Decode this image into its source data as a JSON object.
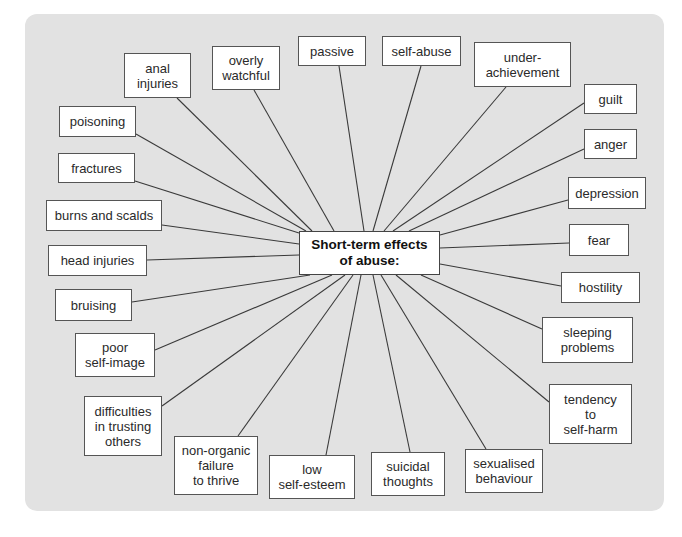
{
  "diagram": {
    "type": "spider-diagram",
    "colors": {
      "panel": "#e2e2e2",
      "box": "#ffffff",
      "border": "#555555",
      "line": "#3a3a3a",
      "text": "#2a2a2a"
    },
    "center": {
      "label": "Short-term effects\nof abuse:",
      "box": [
        299,
        231,
        141,
        44
      ]
    },
    "nodes": [
      {
        "id": "anal-injuries",
        "label": "anal\ninjuries",
        "box": [
          124,
          53,
          67,
          45
        ],
        "line": [
          177,
          98,
          312,
          231
        ]
      },
      {
        "id": "overly-watchful",
        "label": "overly\nwatchful",
        "box": [
          212,
          46,
          68,
          44
        ],
        "line": [
          254,
          90,
          334,
          231
        ]
      },
      {
        "id": "passive",
        "label": "passive",
        "box": [
          298,
          36,
          68,
          30
        ],
        "line": [
          339,
          66,
          364,
          231
        ]
      },
      {
        "id": "self-abuse",
        "label": "self-abuse",
        "box": [
          382,
          36,
          79,
          30
        ],
        "line": [
          421,
          66,
          373,
          231
        ]
      },
      {
        "id": "under-achievement",
        "label": "under-\nachievement",
        "box": [
          474,
          42,
          97,
          45
        ],
        "line": [
          506,
          87,
          384,
          231
        ]
      },
      {
        "id": "guilt",
        "label": "guilt",
        "box": [
          584,
          84,
          53,
          30
        ],
        "line": [
          584,
          103,
          393,
          231
        ]
      },
      {
        "id": "anger",
        "label": "anger",
        "box": [
          584,
          129,
          53,
          30
        ],
        "line": [
          584,
          149,
          409,
          231
        ]
      },
      {
        "id": "depression",
        "label": "depression",
        "box": [
          568,
          177,
          78,
          32
        ],
        "line": [
          568,
          200,
          440,
          235
        ]
      },
      {
        "id": "fear",
        "label": "fear",
        "box": [
          569,
          224,
          60,
          32
        ],
        "line": [
          569,
          243,
          440,
          248
        ]
      },
      {
        "id": "hostility",
        "label": "hostility",
        "box": [
          561,
          272,
          79,
          31
        ],
        "line": [
          561,
          286,
          440,
          264
        ]
      },
      {
        "id": "sleeping-problems",
        "label": "sleeping\nproblems",
        "box": [
          542,
          317,
          91,
          46
        ],
        "line": [
          542,
          329,
          421,
          275
        ]
      },
      {
        "id": "tendency-to-self-harm",
        "label": "tendency\nto\nself-harm",
        "box": [
          549,
          384,
          83,
          60
        ],
        "line": [
          549,
          402,
          396,
          275
        ]
      },
      {
        "id": "sexualised-behaviour",
        "label": "sexualised\nbehaviour",
        "box": [
          465,
          449,
          78,
          44
        ],
        "line": [
          486,
          449,
          381,
          275
        ]
      },
      {
        "id": "suicidal-thoughts",
        "label": "suicidal\nthoughts",
        "box": [
          371,
          452,
          74,
          44
        ],
        "line": [
          410,
          452,
          373,
          275
        ]
      },
      {
        "id": "low-self-esteem",
        "label": "low\nself-esteem",
        "box": [
          269,
          455,
          86,
          44
        ],
        "line": [
          326,
          455,
          361,
          275
        ]
      },
      {
        "id": "non-organic-failure-to-thrive",
        "label": "non-organic\nfailure\nto thrive",
        "box": [
          174,
          436,
          84,
          59
        ],
        "line": [
          238,
          436,
          353,
          275
        ]
      },
      {
        "id": "difficulties-in-trusting-others",
        "label": "difficulties\nin trusting\nothers",
        "box": [
          84,
          396,
          78,
          60
        ],
        "line": [
          162,
          406,
          345,
          275
        ]
      },
      {
        "id": "poor-self-image",
        "label": "poor\nself-image",
        "box": [
          75,
          333,
          80,
          44
        ],
        "line": [
          155,
          350,
          332,
          275
        ]
      },
      {
        "id": "bruising",
        "label": "bruising",
        "box": [
          55,
          289,
          77,
          32
        ],
        "line": [
          132,
          302,
          310,
          275
        ]
      },
      {
        "id": "head-injuries",
        "label": "head injuries",
        "box": [
          48,
          245,
          99,
          31
        ],
        "line": [
          147,
          260,
          299,
          255
        ]
      },
      {
        "id": "burns-and-scalds",
        "label": "burns and scalds",
        "box": [
          46,
          200,
          116,
          31
        ],
        "line": [
          162,
          225,
          299,
          244
        ]
      },
      {
        "id": "fractures",
        "label": "fractures",
        "box": [
          58,
          153,
          77,
          30
        ],
        "line": [
          135,
          181,
          299,
          233
        ]
      },
      {
        "id": "poisoning",
        "label": "poisoning",
        "box": [
          59,
          106,
          77,
          31
        ],
        "line": [
          136,
          134,
          306,
          231
        ]
      }
    ]
  }
}
